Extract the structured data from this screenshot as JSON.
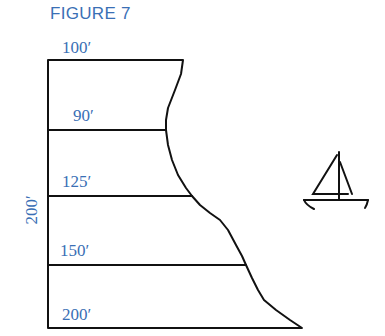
{
  "figure": {
    "title": "FIGURE 7",
    "height_label": "200′",
    "widths": [
      {
        "label": "100′",
        "y": 60
      },
      {
        "label": "90′",
        "y": 130
      },
      {
        "label": "125′",
        "y": 196
      },
      {
        "label": "150′",
        "y": 265
      },
      {
        "label": "200′",
        "y": 328
      }
    ],
    "icon": "sailboat-icon",
    "colors": {
      "label": "#3a6fb5",
      "line": "#111111"
    }
  }
}
